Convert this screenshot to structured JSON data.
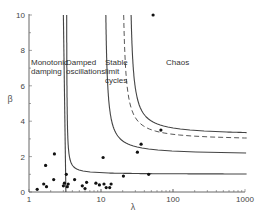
{
  "chart_data": {
    "type": "scatter",
    "title": "",
    "xlabel": "λ",
    "ylabel": "β",
    "xscale": "log",
    "xlim": [
      1,
      1000
    ],
    "ylim": [
      0,
      10
    ],
    "x_ticks": [
      "1",
      "10",
      "100",
      "1000"
    ],
    "y_ticks": [
      "0",
      "2",
      "4",
      "6",
      "8",
      "10"
    ],
    "grid": false,
    "regions": [
      {
        "label": "Monotonic\ndamping"
      },
      {
        "label": "Damped\noscillations"
      },
      {
        "label": "Stable\nlimit\ncycles"
      },
      {
        "label": "Chaos"
      }
    ],
    "boundary_curves": [
      {
        "name": "monotonic-damping-boundary",
        "style": "solid",
        "vertical_asymptote_lambda": 3.1,
        "horizontal_asymptote_beta": null
      },
      {
        "name": "damped-oscillation-boundary",
        "style": "solid",
        "vertical_asymptote_lambda": 3.3,
        "horizontal_asymptote_beta": 1.0
      },
      {
        "name": "limit-cycle-boundary",
        "style": "solid",
        "vertical_asymptote_lambda": 11,
        "horizontal_asymptote_beta": 2.1
      },
      {
        "name": "chaos-boundary-dashed",
        "style": "dashed",
        "vertical_asymptote_lambda": 19,
        "horizontal_asymptote_beta": 2.9
      },
      {
        "name": "chaos-boundary",
        "style": "solid",
        "vertical_asymptote_lambda": 24,
        "horizontal_asymptote_beta": 3.2
      }
    ],
    "points": [
      {
        "x": 1.3,
        "y": 0.15
      },
      {
        "x": 1.6,
        "y": 0.45
      },
      {
        "x": 1.7,
        "y": 1.5
      },
      {
        "x": 1.75,
        "y": 0.3
      },
      {
        "x": 2.2,
        "y": 0.7
      },
      {
        "x": 2.25,
        "y": 2.15
      },
      {
        "x": 3.0,
        "y": 0.35
      },
      {
        "x": 3.1,
        "y": 0.5
      },
      {
        "x": 3.3,
        "y": 1.0
      },
      {
        "x": 3.4,
        "y": 0.3
      },
      {
        "x": 3.5,
        "y": 0.45
      },
      {
        "x": 4.3,
        "y": 0.7
      },
      {
        "x": 5.5,
        "y": 0.35
      },
      {
        "x": 6.0,
        "y": 0.2
      },
      {
        "x": 6.3,
        "y": 0.55
      },
      {
        "x": 8.5,
        "y": 0.5
      },
      {
        "x": 9.5,
        "y": 0.4
      },
      {
        "x": 10.7,
        "y": 1.95
      },
      {
        "x": 11.0,
        "y": 0.45
      },
      {
        "x": 11.8,
        "y": 0.25
      },
      {
        "x": 13.2,
        "y": 0.25
      },
      {
        "x": 13.8,
        "y": 0.45
      },
      {
        "x": 20.5,
        "y": 0.9
      },
      {
        "x": 32,
        "y": 2.25
      },
      {
        "x": 36,
        "y": 2.7
      },
      {
        "x": 46,
        "y": 1.0
      },
      {
        "x": 53,
        "y": 10.0
      },
      {
        "x": 68,
        "y": 3.5
      }
    ]
  }
}
